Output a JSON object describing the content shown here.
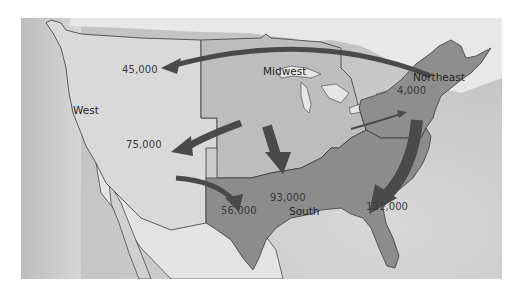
{
  "map": {
    "title": "",
    "type": "migration flow map",
    "regions": [
      {
        "id": "west",
        "name": "West",
        "color": "#d9d9d9"
      },
      {
        "id": "midwest",
        "name": "Midwest",
        "color": "#bdbdbd"
      },
      {
        "id": "northeast",
        "name": "Northeast",
        "color": "#8e8e8e"
      },
      {
        "id": "south",
        "name": "South",
        "color": "#8c8c8c"
      }
    ],
    "flows": [
      {
        "from": "Northeast",
        "to": "West",
        "value": "45,000"
      },
      {
        "from": "Midwest",
        "to": "West",
        "value": "75,000"
      },
      {
        "from": "West",
        "to": "South",
        "value": "56,000"
      },
      {
        "from": "Midwest",
        "to": "South",
        "value": "93,000"
      },
      {
        "from": "Northeast",
        "to": "South",
        "value": "121,000"
      },
      {
        "from": "Midwest",
        "to": "Northeast",
        "value": "4,000"
      }
    ],
    "colors": {
      "water": "#c9c9c9",
      "land_outside": "#e6e6e6",
      "arrow": "#4a4a4a",
      "border": "#3a3a3a"
    }
  }
}
